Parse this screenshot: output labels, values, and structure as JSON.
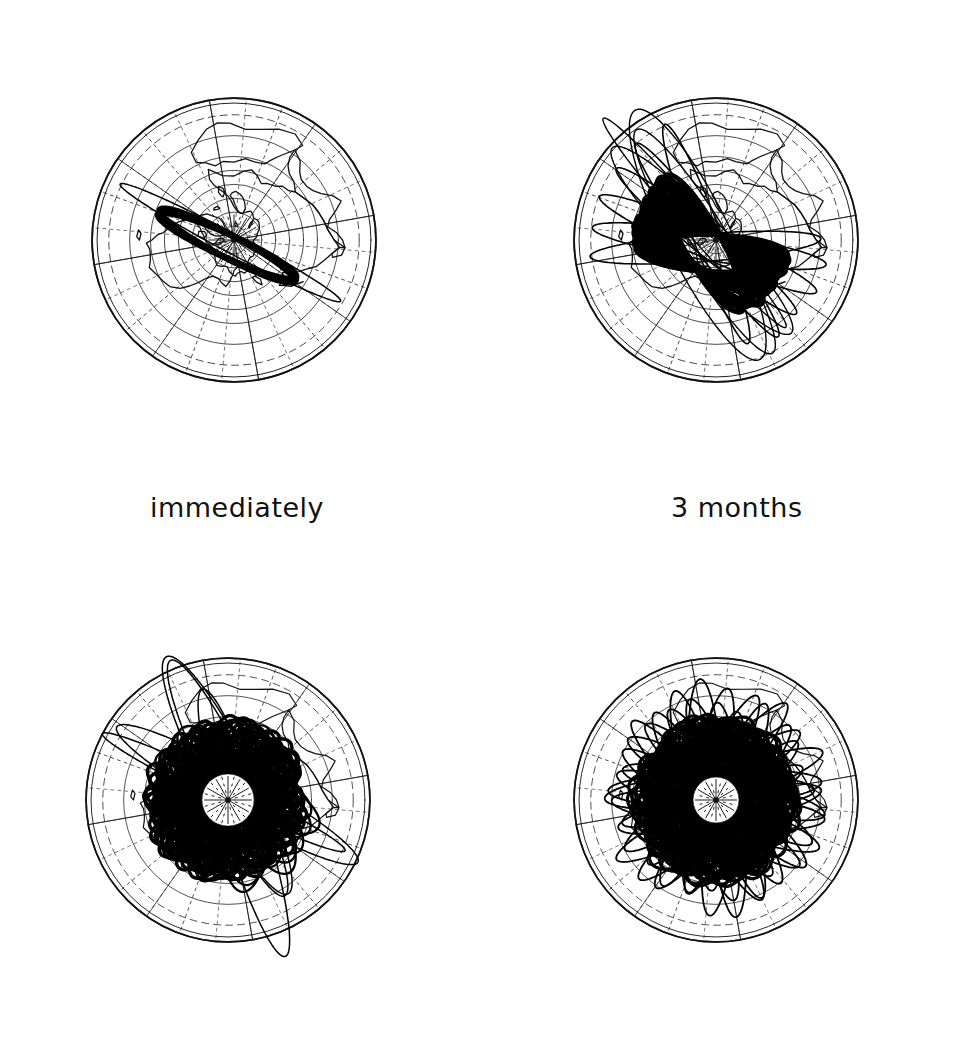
{
  "figure": {
    "background_color": "#ffffff",
    "ink_color": "#000000",
    "panel_count": 4,
    "projection": "north-polar azimuthal",
    "graticule": {
      "meridian_count": 24,
      "parallel_count": 8,
      "pole_label": "north pole",
      "equator_visible": true
    }
  },
  "captions": {
    "immediately": "immediately",
    "three_months": "3 months"
  },
  "chart_data": {
    "type": "line",
    "xlabel": "",
    "ylabel": "",
    "panels": [
      {
        "id": "panel-immediately",
        "caption": "immediately",
        "position": "top-left",
        "center": [
          234,
          240
        ],
        "radius": 160,
        "orbit_count": 1,
        "node_spread_deg": 4,
        "coverage_fraction": 0.02,
        "description": "single highly eccentric orbit, plane nearly edge-on, apogee loop above upper-left limb and perigee loop below lower-right limb"
      },
      {
        "id": "panel-3-months",
        "caption": "3 months",
        "position": "top-right",
        "center": [
          716,
          240
        ],
        "radius": 160,
        "orbit_count": 26,
        "node_spread_deg": 62,
        "coverage_fraction": 0.18,
        "description": "orbit planes precessed into a dense filled fan occupying one sector, plus a few outlying rings"
      },
      {
        "id": "panel-bottom-left",
        "caption": "",
        "position": "bottom-left",
        "center": [
          228,
          800
        ],
        "radius": 160,
        "orbit_count": 70,
        "node_spread_deg": 230,
        "coverage_fraction": 0.62,
        "description": "precession has swept most longitudes leaving a wedge of lighter coverage toward lower-left"
      },
      {
        "id": "panel-bottom-right",
        "caption": "",
        "position": "bottom-right",
        "center": [
          716,
          800
        ],
        "radius": 160,
        "orbit_count": 96,
        "node_spread_deg": 360,
        "coverage_fraction": 0.95,
        "clear_polar_cap_radius": 22,
        "description": "full rosette, all longitudes covered, small clear circular cap remaining at the pole"
      }
    ],
    "series": [
      {
        "name": "elapsed time label",
        "values": [
          "immediately",
          "3 months",
          "",
          ""
        ]
      },
      {
        "name": "orbits drawn",
        "values": [
          1,
          26,
          70,
          96
        ]
      },
      {
        "name": "node spread (deg)",
        "values": [
          4,
          62,
          230,
          360
        ]
      }
    ],
    "orbit_geometry": {
      "eccentricity": 0.72,
      "apogee_radius_ratio": 1.18,
      "perigee_radius_ratio": 0.1,
      "inclination_deg": 63
    },
    "legend": [],
    "grid": true
  }
}
